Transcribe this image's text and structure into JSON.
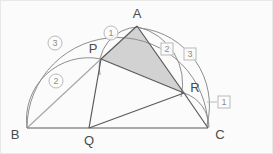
{
  "diagram": {
    "type": "euclidean-geometry-semicircle",
    "canvas": {
      "width": 273,
      "height": 154,
      "background": "#fbfbfb",
      "border": "#e8e8e8"
    },
    "colors": {
      "stroke_dark": "#5a5a5a",
      "stroke_light": "#a8a8a8",
      "arc": "#8e8e8e",
      "shade_fill": "#d2d2d2",
      "label_text": "#4a4a4a",
      "annotation_text": "#8e8e8e",
      "annotation_border": "#b9b9b9"
    },
    "points": [
      {
        "name": "A",
        "x": 136,
        "y": 25,
        "label": "A",
        "label_x": 136,
        "label_y": 12
      },
      {
        "name": "B",
        "x": 26,
        "y": 127,
        "label": "B",
        "label_x": 14,
        "label_y": 133
      },
      {
        "name": "C",
        "x": 207,
        "y": 127,
        "label": "C",
        "label_x": 219,
        "label_y": 133
      },
      {
        "name": "P",
        "x": 100,
        "y": 58,
        "label": "P",
        "label_x": 92,
        "label_y": 47
      },
      {
        "name": "Q",
        "x": 88,
        "y": 127,
        "label": "Q",
        "label_x": 88,
        "label_y": 139
      },
      {
        "name": "R",
        "x": 183,
        "y": 92,
        "label": "R",
        "label_x": 194,
        "label_y": 86
      }
    ],
    "segments": [
      {
        "name": "base-BC",
        "from": "B",
        "to": "C",
        "weight": "dark"
      },
      {
        "name": "side-AP",
        "from": "A",
        "to": "P",
        "weight": "dark"
      },
      {
        "name": "side-AR",
        "from": "A",
        "to": "R",
        "weight": "dark"
      },
      {
        "name": "side-PR",
        "from": "P",
        "to": "R",
        "weight": "dark"
      },
      {
        "name": "segment-BP",
        "from": "B",
        "to": "P",
        "weight": "light"
      },
      {
        "name": "segment-PQ",
        "from": "P",
        "to": "Q",
        "weight": "dark"
      },
      {
        "name": "segment-QR",
        "from": "Q",
        "to": "R",
        "weight": "dark"
      },
      {
        "name": "segment-RC",
        "from": "R",
        "to": "C",
        "weight": "dark"
      }
    ],
    "shaded_region": {
      "name": "triangle-APR",
      "vertices": [
        "A",
        "P",
        "R"
      ],
      "fill": "#d2d2d2"
    },
    "arcs": [
      {
        "name": "semicircle-BAC",
        "from": "B",
        "to": "C",
        "through": "A",
        "annotation": "3"
      },
      {
        "name": "arc-B-to-P",
        "from": "B",
        "to": "P",
        "annotation": "2"
      },
      {
        "name": "arc-P-to-A",
        "from": "P",
        "to": "A",
        "annotation": "1"
      },
      {
        "name": "arc-A-to-R-inner",
        "from": "A",
        "to": "R",
        "annotation": "2"
      },
      {
        "name": "arc-A-to-C-outer",
        "from": "A",
        "to": "C",
        "annotation": "3"
      },
      {
        "name": "arc-R-to-C",
        "from": "R",
        "to": "C",
        "annotation": "1"
      }
    ],
    "annotations": {
      "circled": [
        {
          "name": "circled-label-1",
          "text": "1",
          "x": 110,
          "y": 32
        },
        {
          "name": "circled-label-2",
          "text": "2",
          "x": 55,
          "y": 80
        },
        {
          "name": "circled-label-3",
          "text": "3",
          "x": 54,
          "y": 42
        }
      ],
      "boxed": [
        {
          "name": "boxed-label-1",
          "text": "1",
          "x": 223,
          "y": 101
        },
        {
          "name": "boxed-label-2",
          "text": "2",
          "x": 166,
          "y": 48
        },
        {
          "name": "boxed-label-3",
          "text": "3",
          "x": 189,
          "y": 53
        }
      ]
    }
  }
}
